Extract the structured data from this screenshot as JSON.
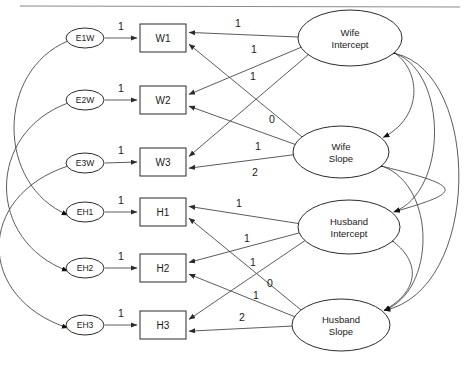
{
  "diagram": {
    "type": "sem-path-diagram",
    "colors": {
      "stroke": "#2b2b2b",
      "edge": "#4a4a4a",
      "fill": "#ffffff",
      "rule": "#8a8a8a"
    },
    "top_rule": {
      "x1": 20,
      "y1": 6,
      "x2": 460,
      "y2": 7
    },
    "errors": [
      {
        "id": "e1w",
        "label": "E1W",
        "cx": 85,
        "cy": 38,
        "rx": 19,
        "ry": 10
      },
      {
        "id": "e2w",
        "label": "E2W",
        "cx": 85,
        "cy": 100,
        "rx": 19,
        "ry": 10
      },
      {
        "id": "e3w",
        "label": "E3W",
        "cx": 85,
        "cy": 163,
        "rx": 19,
        "ry": 10
      },
      {
        "id": "eh1",
        "label": "EH1",
        "cx": 85,
        "cy": 212,
        "rx": 19,
        "ry": 10
      },
      {
        "id": "eh2",
        "label": "EH2",
        "cx": 85,
        "cy": 268,
        "rx": 19,
        "ry": 10
      },
      {
        "id": "eh3",
        "label": "EH3",
        "cx": 85,
        "cy": 325,
        "rx": 19,
        "ry": 10
      }
    ],
    "indicators": [
      {
        "id": "w1",
        "label": "W1",
        "x": 140,
        "y": 24,
        "w": 46,
        "h": 28
      },
      {
        "id": "w2",
        "label": "W2",
        "x": 140,
        "y": 86,
        "w": 46,
        "h": 28
      },
      {
        "id": "w3",
        "label": "W3",
        "x": 140,
        "y": 148,
        "w": 46,
        "h": 28
      },
      {
        "id": "h1",
        "label": "H1",
        "x": 140,
        "y": 198,
        "w": 46,
        "h": 28
      },
      {
        "id": "h2",
        "label": "H2",
        "x": 140,
        "y": 254,
        "w": 46,
        "h": 28
      },
      {
        "id": "h3",
        "label": "H3",
        "x": 140,
        "y": 311,
        "w": 46,
        "h": 28
      }
    ],
    "latents": [
      {
        "id": "wi",
        "line1": "Wife",
        "line2": "Intercept",
        "cx": 350,
        "cy": 38,
        "rx": 52,
        "ry": 28
      },
      {
        "id": "ws",
        "line1": "Wife",
        "line2": "Slope",
        "cx": 341,
        "cy": 152,
        "rx": 48,
        "ry": 26
      },
      {
        "id": "hi",
        "line1": "Husband",
        "line2": "Intercept",
        "cx": 349,
        "cy": 227,
        "rx": 51,
        "ry": 27
      },
      {
        "id": "hs",
        "line1": "Husband",
        "line2": "Slope",
        "cx": 341,
        "cy": 325,
        "rx": 49,
        "ry": 26
      }
    ],
    "error_loadings": [
      {
        "id": "e1w-w1",
        "value": "1",
        "lx": 121,
        "ly": 26
      },
      {
        "id": "e2w-w2",
        "value": "1",
        "lx": 121,
        "ly": 88
      },
      {
        "id": "e3w-w3",
        "value": "1",
        "lx": 121,
        "ly": 150
      },
      {
        "id": "eh1-h1",
        "value": "1",
        "lx": 121,
        "ly": 200
      },
      {
        "id": "eh2-h2",
        "value": "1",
        "lx": 121,
        "ly": 256
      },
      {
        "id": "eh3-h3",
        "value": "1",
        "lx": 121,
        "ly": 313
      }
    ],
    "factor_loadings": [
      {
        "id": "wi-w1",
        "from": "wi",
        "to": "w1",
        "value": "1",
        "lx": 238,
        "ly": 23
      },
      {
        "id": "wi-w2",
        "from": "wi",
        "to": "w2",
        "value": "1",
        "lx": 254,
        "ly": 49
      },
      {
        "id": "wi-w3",
        "from": "wi",
        "to": "w3",
        "value": "1",
        "lx": 253,
        "ly": 76
      },
      {
        "id": "ws-w1",
        "from": "ws",
        "to": "w1",
        "value": "0",
        "lx": 272,
        "ly": 119
      },
      {
        "id": "ws-w2",
        "from": "ws",
        "to": "w2",
        "value": "1",
        "lx": 258,
        "ly": 146
      },
      {
        "id": "ws-w3",
        "from": "ws",
        "to": "w3",
        "value": "2",
        "lx": 255,
        "ly": 172
      },
      {
        "id": "hi-h1",
        "from": "hi",
        "to": "h1",
        "value": "1",
        "lx": 239,
        "ly": 203
      },
      {
        "id": "hi-h2",
        "from": "hi",
        "to": "h2",
        "value": "1",
        "lx": 247,
        "ly": 238
      },
      {
        "id": "hi-h3",
        "from": "hi",
        "to": "h3",
        "value": "1",
        "lx": 253,
        "ly": 262
      },
      {
        "id": "hs-h1",
        "from": "hs",
        "to": "h1",
        "value": "0",
        "lx": 270,
        "ly": 283
      },
      {
        "id": "hs-h2",
        "from": "hs",
        "to": "h2",
        "value": "1",
        "lx": 256,
        "ly": 295
      },
      {
        "id": "hs-h3",
        "from": "hs",
        "to": "h3",
        "value": "2",
        "lx": 242,
        "ly": 317
      }
    ],
    "error_covariances": [
      {
        "id": "cov-e1w-eh1",
        "from": "e1w",
        "to": "eh1"
      },
      {
        "id": "cov-e2w-eh2",
        "from": "e2w",
        "to": "eh2"
      },
      {
        "id": "cov-e3w-eh3",
        "from": "e3w",
        "to": "eh3"
      }
    ],
    "latent_covariances": [
      {
        "id": "cov-wi-ws",
        "from": "wi",
        "to": "ws"
      },
      {
        "id": "cov-hi-hs",
        "from": "hi",
        "to": "hs"
      },
      {
        "id": "cov-wi-hi",
        "from": "wi",
        "to": "hi"
      },
      {
        "id": "cov-ws-hs",
        "from": "ws",
        "to": "hs"
      },
      {
        "id": "cov-wi-hs",
        "from": "wi",
        "to": "hs"
      },
      {
        "id": "cov-ws-hi",
        "from": "ws",
        "to": "hi"
      }
    ]
  }
}
